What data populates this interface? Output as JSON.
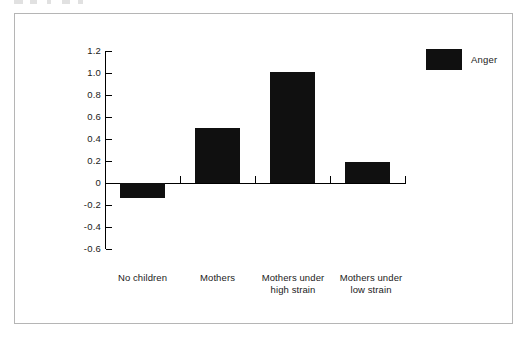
{
  "figure": {
    "frame_border_color": "#b5b5b5",
    "background_color": "#ffffff",
    "bar_color": "#101010"
  },
  "legend": {
    "entries": [
      {
        "label": "Anger",
        "color": "#101010",
        "swatch_icon": "filled-square-swatch"
      }
    ],
    "position": "top-right"
  },
  "axis": {
    "y_ticks": [
      "1.2",
      "1.0",
      "0.8",
      "0.6",
      "0.4",
      "0.2",
      "0",
      "-0.2",
      "-0.4",
      "-0.6"
    ]
  },
  "chart_data": {
    "type": "bar",
    "title": "",
    "subtitle": "",
    "xlabel": "",
    "ylabel": "",
    "categories": [
      "No children",
      "Mothers",
      "Mothers under high strain",
      "Mothers under low strain"
    ],
    "category_lines": [
      [
        "No children"
      ],
      [
        "Mothers"
      ],
      [
        "Mothers under",
        "high strain"
      ],
      [
        "Mothers under",
        "low strain"
      ]
    ],
    "series": [
      {
        "name": "Anger",
        "color": "#101010",
        "values": [
          -0.14,
          0.5,
          1.01,
          0.19
        ]
      }
    ],
    "values": [
      -0.14,
      0.5,
      1.01,
      0.19
    ],
    "ylim": [
      -0.6,
      1.2
    ],
    "ytick_values": [
      1.2,
      1.0,
      0.8,
      0.6,
      0.4,
      0.2,
      0,
      -0.2,
      -0.4,
      -0.6
    ],
    "ytick_labels": [
      "1.2",
      "1.0",
      "0.8",
      "0.6",
      "0.4",
      "0.2",
      "0",
      "-0.2",
      "-0.4",
      "-0.6"
    ],
    "grid": false,
    "legend_position": "top-right",
    "zero_line": true
  }
}
